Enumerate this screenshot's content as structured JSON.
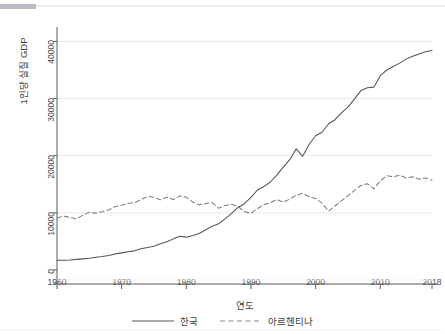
{
  "figure": {
    "background_color": "#ffffff",
    "line_color": "#555555",
    "gridline_color": "#e8e8e8",
    "axis_color": "#5a5a5a",
    "top_strip_dark": "#b9bcc0",
    "top_strip_light": "#eceef0"
  },
  "chart_data": {
    "type": "line",
    "title": "",
    "xlabel": "연도",
    "ylabel": "1인당 실질 GDP",
    "xlim": [
      1960,
      2018
    ],
    "ylim": [
      0,
      42000
    ],
    "xticks": [
      1960,
      1970,
      1980,
      1990,
      2000,
      2010,
      2018
    ],
    "yticks": [
      0,
      10000,
      20000,
      30000,
      40000
    ],
    "xtick_labels": [
      "1960",
      "1970",
      "1980",
      "1990",
      "2000",
      "2010",
      "2018"
    ],
    "ytick_labels": [
      "0",
      "10000",
      "20000",
      "30000",
      "40000"
    ],
    "grid": "horizontal",
    "legend_position": "bottom",
    "x": [
      1960,
      1961,
      1962,
      1963,
      1964,
      1965,
      1966,
      1967,
      1968,
      1969,
      1970,
      1971,
      1972,
      1973,
      1974,
      1975,
      1976,
      1977,
      1978,
      1979,
      1980,
      1981,
      1982,
      1983,
      1984,
      1985,
      1986,
      1987,
      1988,
      1989,
      1990,
      1991,
      1992,
      1993,
      1994,
      1995,
      1996,
      1997,
      1998,
      1999,
      2000,
      2001,
      2002,
      2003,
      2004,
      2005,
      2006,
      2007,
      2008,
      2009,
      2010,
      2011,
      2012,
      2013,
      2014,
      2015,
      2016,
      2017,
      2018
    ],
    "series": [
      {
        "name": "한국",
        "style": "solid",
        "color": "#555555",
        "values": [
          1700,
          1720,
          1760,
          1860,
          1950,
          2050,
          2230,
          2350,
          2550,
          2820,
          3000,
          3200,
          3350,
          3700,
          3950,
          4150,
          4600,
          4950,
          5450,
          5900,
          5750,
          6050,
          6400,
          7050,
          7650,
          8100,
          8950,
          9900,
          10950,
          11600,
          12700,
          14000,
          14600,
          15400,
          16600,
          18000,
          19300,
          21200,
          19900,
          22000,
          23500,
          24100,
          25600,
          26300,
          27500,
          28500,
          29900,
          31400,
          31900,
          32000,
          34000,
          35000,
          35600,
          36200,
          36900,
          37400,
          37800,
          38200,
          38400
        ]
      },
      {
        "name": "아르헨티나",
        "style": "dashed",
        "color": "#555555",
        "values": [
          9100,
          9450,
          9200,
          8950,
          9600,
          10100,
          9950,
          10200,
          10500,
          11100,
          11350,
          11650,
          11800,
          12300,
          12900,
          12700,
          12300,
          12750,
          12350,
          12950,
          12750,
          11900,
          11400,
          11650,
          11800,
          10800,
          11300,
          11500,
          11100,
          10200,
          9950,
          10750,
          11450,
          11800,
          12350,
          11850,
          12400,
          13100,
          13400,
          12800,
          12500,
          11700,
          10300,
          11200,
          12100,
          13000,
          13900,
          14800,
          15100,
          14200,
          15600,
          16500,
          16300,
          16600,
          16100,
          16300,
          15900,
          16100,
          15700
        ]
      }
    ],
    "annotations": []
  },
  "legend": {
    "items": [
      {
        "label": "한국",
        "style": "solid"
      },
      {
        "label": "아르헨티나",
        "style": "dashed"
      }
    ]
  }
}
